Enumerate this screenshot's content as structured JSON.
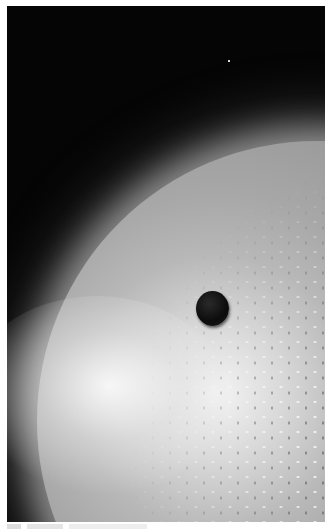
{
  "image": {
    "description": "Grayscale artistic rendering of a bright star surface with a dark planet transiting in front of it against a starfield",
    "colors": {
      "space": "#050505",
      "star_surface": "#b0b0b0",
      "star_highlight": "#f4f4f4",
      "planet": "#0c0c0c",
      "page_background": "#ffffff"
    }
  },
  "caption": {
    "visible": true,
    "legible": false
  }
}
